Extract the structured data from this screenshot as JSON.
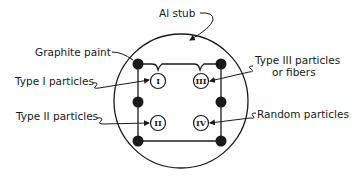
{
  "diagram": {
    "labels": {
      "stub": "Al stub",
      "graphite": "Graphite paint",
      "type1": "Type I particles",
      "type2": "Type II particles",
      "type3_line1": "Type III particles",
      "type3_line2": "or fibers",
      "random": "Random particles"
    },
    "regions": {
      "r1": "I",
      "r2": "II",
      "r3": "III",
      "r4": "IV"
    },
    "colors": {
      "ink": "#1a1a1a",
      "background": "#ffffff"
    }
  }
}
